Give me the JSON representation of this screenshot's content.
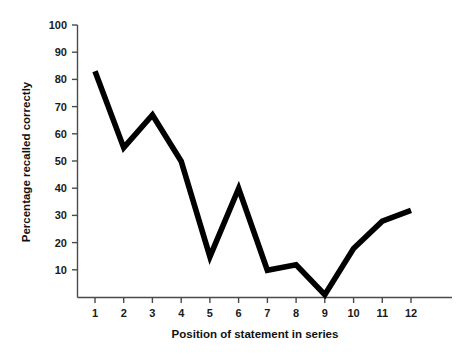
{
  "chart_data": {
    "type": "line",
    "title": "",
    "subtitle": "",
    "xlabel": "Position of statement in series",
    "ylabel": "Percentage recalled correctly",
    "categories": [
      1,
      2,
      3,
      4,
      5,
      6,
      7,
      8,
      9,
      10,
      11,
      12
    ],
    "x": [
      1,
      2,
      3,
      4,
      5,
      6,
      7,
      8,
      9,
      10,
      11,
      12
    ],
    "values": [
      83,
      55,
      67,
      50,
      15,
      40,
      10,
      12,
      1,
      18,
      28,
      32
    ],
    "series": [
      {
        "name": "Percentage recalled correctly",
        "values": [
          83,
          55,
          67,
          50,
          15,
          40,
          10,
          12,
          1,
          18,
          28,
          32
        ]
      }
    ],
    "xlim": [
      0.6,
      12.6
    ],
    "ylim": [
      0,
      100
    ],
    "xticks": [
      1,
      2,
      3,
      4,
      5,
      6,
      7,
      8,
      9,
      10,
      11,
      12
    ],
    "xtick_labels": [
      "1",
      "2",
      "3",
      "4",
      "5",
      "6",
      "7",
      "8",
      "9",
      "10",
      "11",
      "12"
    ],
    "yticks": [
      10,
      20,
      30,
      40,
      50,
      60,
      70,
      80,
      90,
      100
    ],
    "ytick_labels": [
      "10",
      "20",
      "30",
      "40",
      "50",
      "60",
      "70",
      "80",
      "90",
      "100"
    ],
    "grid": false,
    "legend": false,
    "legend_position": "none",
    "line_color": "#000000",
    "axis_color": "#4a4a4a",
    "background_color": "#ffffff",
    "annotations": []
  },
  "axes": {
    "y_title": "Percentage recalled correctly",
    "x_title": "Position of statement in series"
  }
}
